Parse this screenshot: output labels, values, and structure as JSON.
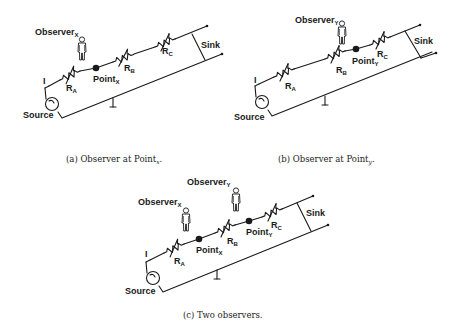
{
  "figure": {
    "panels": [
      {
        "id": "a",
        "caption_prefix": "(a)",
        "caption_text": "Observer at Point",
        "caption_sub": "x",
        "caption_suffix": ".",
        "labels": {
          "source": "Source",
          "sink": "Sink",
          "current": "I",
          "ra": "R",
          "ra_sub": "A",
          "rb": "R",
          "rb_sub": "B",
          "rc": "R",
          "rc_sub": "C",
          "point_x": "Point",
          "point_x_sub": "X",
          "observer_x": "Observer",
          "observer_x_sub": "X"
        }
      },
      {
        "id": "b",
        "caption_prefix": "(b)",
        "caption_text": "Observer at Point",
        "caption_sub": "y",
        "caption_suffix": ".",
        "labels": {
          "source": "Source",
          "sink": "Sink",
          "current": "I",
          "ra": "R",
          "ra_sub": "A",
          "rb": "R",
          "rb_sub": "B",
          "rc": "R",
          "rc_sub": "C",
          "point_y": "Point",
          "point_y_sub": "Y",
          "observer_y": "Observer",
          "observer_y_sub": "Y"
        }
      },
      {
        "id": "c",
        "caption_prefix": "(c)",
        "caption_text": "Two observers.",
        "labels": {
          "source": "Source",
          "sink": "Sink",
          "current": "I",
          "ra": "R",
          "ra_sub": "A",
          "rb": "R",
          "rb_sub": "B",
          "rc": "R",
          "rc_sub": "C",
          "point_x": "Point",
          "point_x_sub": "X",
          "point_y": "Point",
          "point_y_sub": "Y",
          "observer_x": "Observer",
          "observer_x_sub": "X",
          "observer_y": "Observer",
          "observer_y_sub": "Y"
        }
      }
    ]
  }
}
